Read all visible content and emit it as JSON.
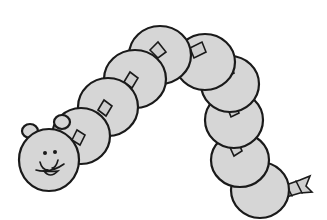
{
  "image": {
    "subject": "caterpillar made of grey discs threaded on a twisted rope",
    "style": "black-outline clip art, light grey fill",
    "colors": {
      "background": "#ffffff",
      "fill": "#d6d6d6",
      "outline": "#1a1a1a"
    },
    "parts": {
      "head": {
        "features": [
          "two ears",
          "two dot eyes",
          "smiling mouth with tongue"
        ]
      },
      "body_segments": 10,
      "tail": "frayed rope end"
    }
  }
}
